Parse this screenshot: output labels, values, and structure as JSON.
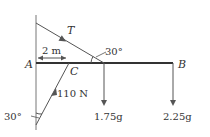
{
  "diagram": {
    "labels": {
      "A": "A",
      "B": "B",
      "C": "C",
      "tension": "T",
      "distance": "2 m",
      "angle_top": "30°",
      "angle_bottom": "30°",
      "strut_force": "110 N",
      "load_mid": "1.75g",
      "load_end": "2.25g"
    },
    "colors": {
      "rod": "#333333",
      "line": "#555555",
      "text": "#333333"
    }
  }
}
